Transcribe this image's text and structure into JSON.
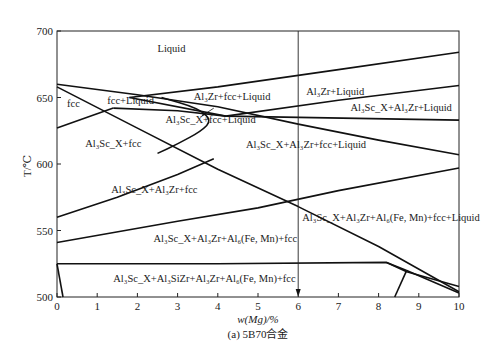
{
  "chart_data": {
    "type": "line",
    "title": "",
    "caption": "(a) 5B70合金",
    "xlabel": "w(Mg)/%",
    "ylabel": "T/℃",
    "xlim": [
      0,
      10
    ],
    "ylim": [
      500,
      700
    ],
    "grid": false,
    "x_ticks": [
      0,
      1,
      2,
      3,
      4,
      5,
      6,
      7,
      8,
      9,
      10
    ],
    "y_ticks": [
      500,
      550,
      600,
      650,
      700
    ],
    "marker_line": {
      "x": 6,
      "label": "6",
      "arrow": "down"
    },
    "phase_boundaries": [
      {
        "name": "liquidus-al3zr",
        "points": [
          [
            1.8,
            650
          ],
          [
            4,
            658
          ],
          [
            7,
            671
          ],
          [
            10,
            684
          ]
        ]
      },
      {
        "name": "al3zr-liquid-lower",
        "points": [
          [
            1.8,
            650
          ],
          [
            4.2,
            636
          ],
          [
            7,
            648
          ],
          [
            10,
            659
          ]
        ]
      },
      {
        "name": "liquidus-fcc",
        "points": [
          [
            0,
            660
          ],
          [
            2,
            652
          ],
          [
            4,
            643
          ],
          [
            6,
            630
          ],
          [
            8,
            618
          ],
          [
            10,
            607
          ]
        ]
      },
      {
        "name": "al3sc-diagonal",
        "points": [
          [
            0,
            658
          ],
          [
            2,
            627
          ],
          [
            4,
            596
          ],
          [
            6,
            568
          ],
          [
            8,
            538
          ],
          [
            10,
            504
          ]
        ]
      },
      {
        "name": "fcc-solvus",
        "points": [
          [
            0,
            627
          ],
          [
            1.4,
            642
          ]
        ]
      },
      {
        "name": "fcc-liquid-lower",
        "points": [
          [
            1.4,
            642
          ],
          [
            3,
            640
          ],
          [
            4.2,
            636
          ],
          [
            10,
            633
          ]
        ]
      },
      {
        "name": "al3sc-lens",
        "points": [
          [
            2.6,
            650
          ],
          [
            3.5,
            642
          ],
          [
            3.85,
            633
          ],
          [
            3.6,
            625
          ],
          [
            3,
            615
          ],
          [
            2.5,
            608
          ]
        ]
      },
      {
        "name": "al3zr-solvus",
        "points": [
          [
            0,
            560
          ],
          [
            1.5,
            575
          ],
          [
            3,
            592
          ],
          [
            3.9,
            604
          ]
        ]
      },
      {
        "name": "al6-solvus",
        "points": [
          [
            0,
            541
          ],
          [
            3,
            557
          ],
          [
            5,
            567
          ],
          [
            7,
            580
          ],
          [
            10,
            597
          ]
        ]
      },
      {
        "name": "al3sizr-solvus",
        "points": [
          [
            0,
            525
          ],
          [
            4,
            525
          ],
          [
            8.2,
            526
          ],
          [
            8.7,
            520
          ]
        ]
      },
      {
        "name": "solidus-upper",
        "points": [
          [
            8.2,
            526
          ],
          [
            8.7,
            519
          ],
          [
            10,
            508
          ]
        ]
      },
      {
        "name": "solidus-lower",
        "points": [
          [
            8.7,
            520
          ],
          [
            10,
            503
          ]
        ]
      },
      {
        "name": "mg-solvus-right",
        "points": [
          [
            8.4,
            500
          ],
          [
            8.7,
            520
          ]
        ]
      },
      {
        "name": "mg-solvus-left",
        "points": [
          [
            0,
            525
          ],
          [
            0.15,
            500
          ]
        ]
      }
    ],
    "regions": [
      {
        "label": "Liquid",
        "x": 2.5,
        "y": 684
      },
      {
        "label": "fcc",
        "x": 0.25,
        "y": 643
      },
      {
        "label": "fcc+Liquid",
        "x": 1.25,
        "y": 645
      },
      {
        "label": "Al₃Zr+fcc+Liquid",
        "x": 3.4,
        "y": 648
      },
      {
        "label": "Al₃Zr+Liquid",
        "x": 6.2,
        "y": 652
      },
      {
        "label": "Al₃Sc_X+Al₃Zr+Liquid",
        "x": 7.3,
        "y": 640
      },
      {
        "label": "Al₃Sc_X+fcc+Liquid",
        "x": 2.7,
        "y": 631
      },
      {
        "label": "Al₃Sc_X+fcc",
        "x": 0.7,
        "y": 613
      },
      {
        "label": "Al₃Sc_X+Al₃Zr+fcc+Liquid",
        "x": 4.7,
        "y": 612
      },
      {
        "label": "Al₃Sc_X+Al₃Zr+fcc",
        "x": 1.35,
        "y": 578
      },
      {
        "label": "Al₃Sc_X+Al₃Zr+Al₆(Fe, Mn)+fcc+Liquid",
        "x": 6.1,
        "y": 557
      },
      {
        "label": "Al₃Sc_X+Al₃Zr+Al₆(Fe, Mn)+fcc",
        "x": 2.4,
        "y": 541
      },
      {
        "label": "Al₃Sc_X+Al₃SiZr+Al₃Zr+Al₆(Fe, Mn)+fcc",
        "x": 1.4,
        "y": 511
      }
    ],
    "annotation_arrow": {
      "from": [
        3.9,
        642
      ],
      "to": [
        3.6,
        636
      ]
    }
  }
}
